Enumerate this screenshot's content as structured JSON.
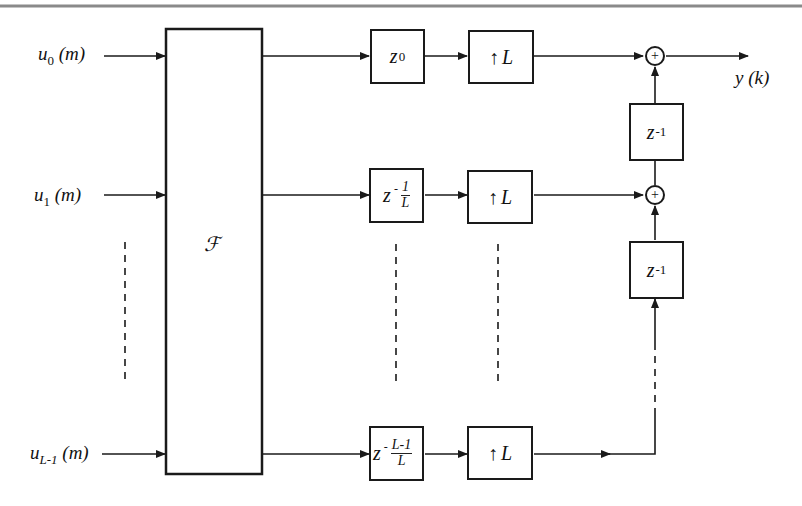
{
  "diagram": {
    "inputs": [
      {
        "base": "u",
        "sub": "0",
        "arg": "(m)"
      },
      {
        "base": "u",
        "sub": "1",
        "arg": "(m)"
      },
      {
        "base": "u",
        "sub": "L-1",
        "arg": "(m)"
      }
    ],
    "transform_block": {
      "label": "ℱ"
    },
    "delay_blocks": [
      {
        "base": "z",
        "exponent": "0"
      },
      {
        "base": "z",
        "sign": "-",
        "frac_num": "1",
        "frac_den": "L"
      },
      {
        "base": "z",
        "sign": "-",
        "frac_num": "L-1",
        "frac_den": "L"
      }
    ],
    "upsampler_blocks": [
      {
        "arrow": "↑",
        "factor": "L"
      },
      {
        "arrow": "↑",
        "factor": "L"
      },
      {
        "arrow": "↑",
        "factor": "L"
      }
    ],
    "unit_delays": [
      {
        "base": "z",
        "exponent": "-1"
      },
      {
        "base": "z",
        "exponent": "-1"
      }
    ],
    "summers": [
      {
        "symbol": "+"
      },
      {
        "symbol": "+"
      }
    ],
    "output": {
      "base": "y",
      "arg": "(k)"
    },
    "colors": {
      "line": "#1a1a1a",
      "top_rule": "#8a8a8a",
      "background": "#ffffff"
    }
  }
}
